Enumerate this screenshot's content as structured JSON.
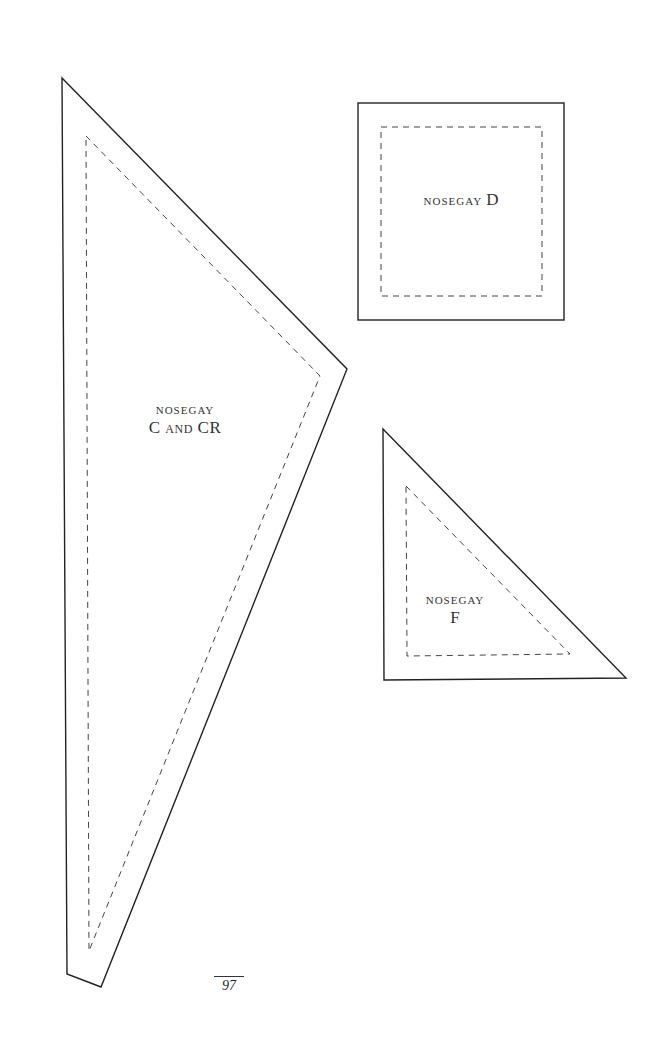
{
  "page": {
    "number": "97"
  },
  "templates": [
    {
      "id": "C",
      "label_line1": "nosegay",
      "label_line2": "C and CR",
      "shape": "triangle",
      "outer": [
        [
          62,
          78
        ],
        [
          347,
          369
        ],
        [
          101,
          987
        ],
        [
          67,
          974
        ]
      ],
      "inner_dashed": [
        [
          86,
          136
        ],
        [
          320,
          376
        ],
        [
          89,
          951
        ]
      ]
    },
    {
      "id": "D",
      "label_line1": "nosegay",
      "label_letter": "D",
      "shape": "square",
      "outer": [
        [
          358,
          103
        ],
        [
          564,
          103
        ],
        [
          564,
          320
        ],
        [
          358,
          320
        ]
      ],
      "inner_dashed": [
        [
          381,
          127
        ],
        [
          542,
          127
        ],
        [
          542,
          296
        ],
        [
          381,
          296
        ]
      ]
    },
    {
      "id": "F",
      "label_line1": "nosegay",
      "label_line2": "F",
      "shape": "triangle",
      "outer": [
        [
          383,
          429
        ],
        [
          626,
          678
        ],
        [
          384,
          680
        ]
      ],
      "inner_dashed": [
        [
          406,
          486
        ],
        [
          570,
          654
        ],
        [
          407,
          656
        ]
      ]
    }
  ],
  "colors": {
    "line": "#222222",
    "dash": "#444444",
    "background": "#ffffff"
  }
}
